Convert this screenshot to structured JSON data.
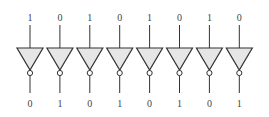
{
  "diagram": {
    "gate_type": "inverter",
    "fill_color": "#e6e6e6",
    "stroke_color": "#333333",
    "gates": [
      {
        "input": "1",
        "output": "0"
      },
      {
        "input": "0",
        "output": "1"
      },
      {
        "input": "1",
        "output": "0"
      },
      {
        "input": "0",
        "output": "1"
      },
      {
        "input": "1",
        "output": "0"
      },
      {
        "input": "0",
        "output": "1"
      },
      {
        "input": "1",
        "output": "0"
      },
      {
        "input": "0",
        "output": "1"
      }
    ]
  }
}
